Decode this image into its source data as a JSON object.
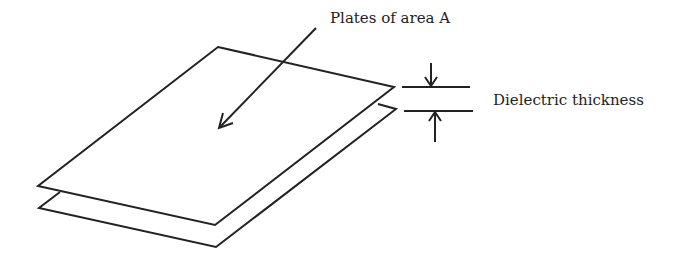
{
  "diagram": {
    "labels": {
      "plates": "Plates of area A",
      "dielectric": "Dielectric thickness"
    },
    "colors": {
      "stroke": "#222222",
      "background": "#ffffff"
    }
  }
}
